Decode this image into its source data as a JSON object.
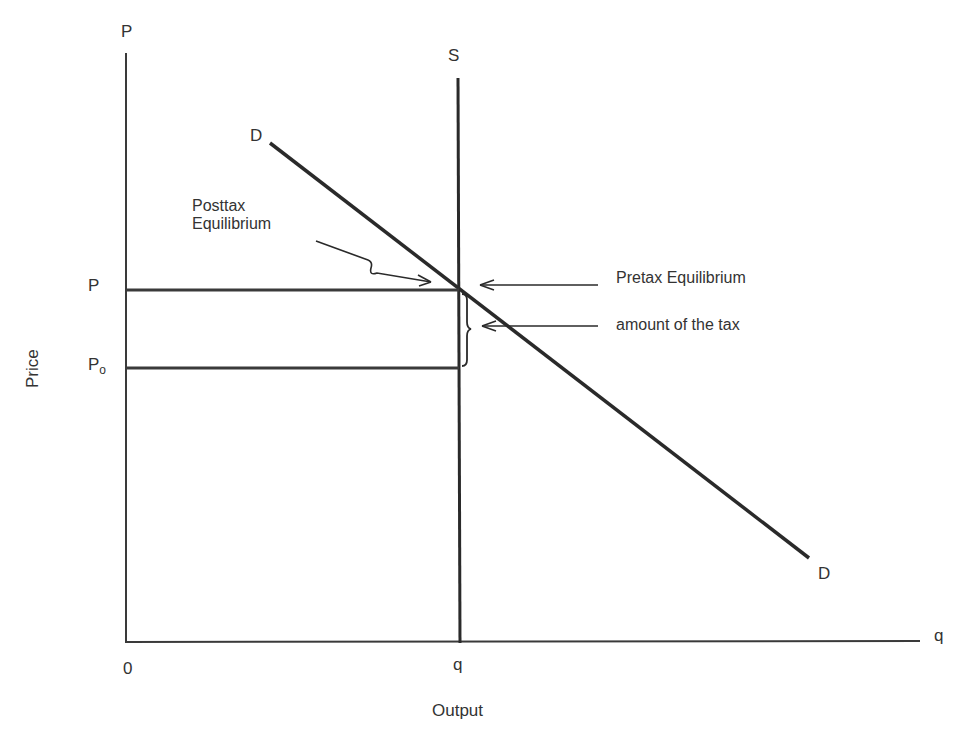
{
  "diagram": {
    "type": "supply-demand",
    "axes": {
      "y_axis_label": "P",
      "y_axis_title": "Price",
      "x_axis_label": "q",
      "x_axis_title": "Output",
      "origin": "0"
    },
    "curves": {
      "supply_label": "S",
      "demand_label_top": "D",
      "demand_label_bottom": "D"
    },
    "price_levels": {
      "p": "P",
      "p0_main": "P",
      "p0_sub": "o"
    },
    "quantity_level": "q",
    "annotations": {
      "posttax_line1": "Posttax",
      "posttax_line2": "Equilibrium",
      "pretax": "Pretax Equilibrium",
      "tax_amount": "amount of the tax"
    },
    "colors": {
      "line": "#2a2a2a",
      "text": "#333333",
      "background": "#ffffff"
    }
  }
}
